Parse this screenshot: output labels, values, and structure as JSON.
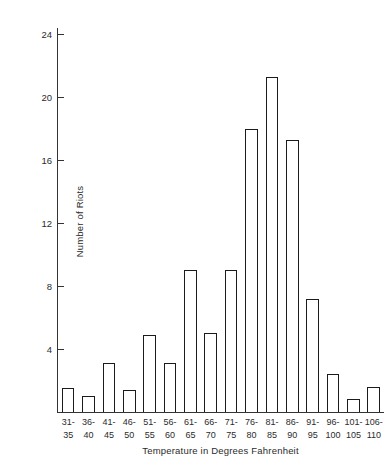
{
  "figure": {
    "running_head": "",
    "background_color": "#ffffff",
    "axis_color": "#333333",
    "bar_edge_color": "#1b1b1b",
    "bar_fill_color": "#ffffff"
  },
  "chart_data": {
    "type": "bar",
    "title": "",
    "subtitle": "",
    "xlabel": "Temperature in Degrees Fahrenheit",
    "ylabel": "Number of Riots",
    "categories": [
      "31-35",
      "36-40",
      "41-45",
      "46-50",
      "51-55",
      "56-60",
      "61-65",
      "66-70",
      "71-75",
      "76-80",
      "81-85",
      "86-90",
      "91-95",
      "96-100",
      "101-105",
      "106-110"
    ],
    "category_lines": [
      [
        "31-",
        "35"
      ],
      [
        "36-",
        "40"
      ],
      [
        "41-",
        "45"
      ],
      [
        "46-",
        "50"
      ],
      [
        "51-",
        "55"
      ],
      [
        "56-",
        "60"
      ],
      [
        "61-",
        "65"
      ],
      [
        "66-",
        "70"
      ],
      [
        "71-",
        "75"
      ],
      [
        "76-",
        "80"
      ],
      [
        "81-",
        "85"
      ],
      [
        "86-",
        "90"
      ],
      [
        "91-",
        "95"
      ],
      [
        "96-",
        "100"
      ],
      [
        "101-",
        "105"
      ],
      [
        "106-",
        "110"
      ]
    ],
    "values": [
      1.5,
      1,
      3.1,
      1.4,
      4.9,
      3.1,
      9,
      5,
      9,
      18,
      21.3,
      17.3,
      7.2,
      2.4,
      0.8,
      1.6
    ],
    "ytick_labels": [
      "4",
      "8",
      "12",
      "16",
      "20",
      "24"
    ],
    "yticks": [
      4,
      8,
      12,
      16,
      20,
      24
    ],
    "ylim": [
      0,
      24.4
    ],
    "xlim_bins": 16,
    "grid": false,
    "legend": "none"
  }
}
